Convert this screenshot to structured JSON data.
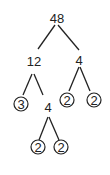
{
  "nodes": {
    "root": {
      "value": "48"
    },
    "left": {
      "value": "12"
    },
    "right": {
      "value": "4"
    },
    "left_left": {
      "value": "3",
      "prime": true
    },
    "left_right": {
      "value": "4"
    },
    "right_left": {
      "value": "2",
      "prime": true
    },
    "right_right": {
      "value": "2",
      "prime": true
    },
    "lr_left": {
      "value": "2",
      "prime": true
    },
    "lr_right": {
      "value": "2",
      "prime": true
    }
  },
  "colors": {
    "ink": "#222222",
    "background": "#ffffff"
  }
}
